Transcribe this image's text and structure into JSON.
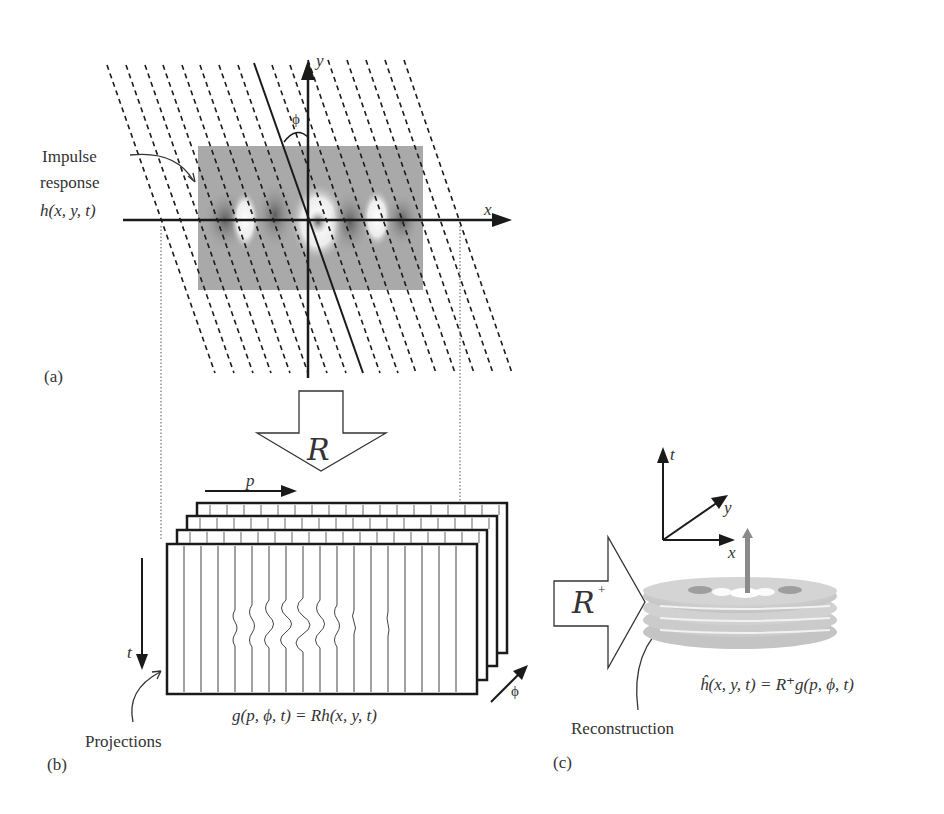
{
  "panel_a": {
    "label": "(a)",
    "impulse_line1": "Impulse",
    "impulse_line2": "response",
    "function": "h(x, y, t)",
    "axis_x": "x",
    "axis_y": "y",
    "angle": "ϕ"
  },
  "transform_R": {
    "symbol": "R"
  },
  "panel_b": {
    "label": "(b)",
    "axis_p": "p",
    "axis_t": "t",
    "axis_phi": "ϕ",
    "projections_label": "Projections",
    "equation": "g(p, ϕ, t) = Rh(x, y, t)"
  },
  "transform_R_plus": {
    "symbol": "R",
    "superscript": "+"
  },
  "panel_c": {
    "label": "(c)",
    "axis_t": "t",
    "axis_y": "y",
    "axis_x": "x",
    "reconstruction_label": "Reconstruction",
    "equation": "ĥ(x, y, t) = R⁺g(p, ϕ, t)"
  },
  "colors": {
    "ink": "#1a1a1a",
    "field_gray": "#a9a9a9",
    "disc_gray": "#c8c8c8",
    "spike": "#8a8a8a"
  }
}
